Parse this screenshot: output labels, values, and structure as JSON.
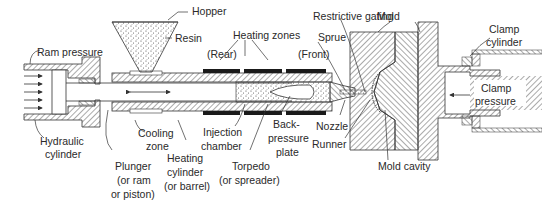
{
  "diagram": {
    "colors": {
      "line": "#333333",
      "hatch": "#555555",
      "heater": "#1a1a1a",
      "background": "#ffffff",
      "resin_dots": "#444444"
    },
    "labels": {
      "ram_pressure": "Ram pressure",
      "hydraulic_cylinder_1": "Hydraulic",
      "hydraulic_cylinder_2": "cylinder",
      "hopper": "Hopper",
      "resin": "Resin",
      "heating_zones": "Heating zones",
      "rear": "(Rear)",
      "front": "(Front)",
      "restrictive_gating": "Restrictive gating",
      "sprue": "Sprue",
      "mold": "Mold",
      "clamp_cylinder_1": "Clamp",
      "clamp_cylinder_2": "cylinder",
      "clamp_pressure_1": "Clamp",
      "clamp_pressure_2": "pressure",
      "cooling_zone_1": "Cooling",
      "cooling_zone_2": "zone",
      "plunger_1": "Plunger",
      "plunger_2": "(or ram",
      "plunger_3": "or piston)",
      "heating_cylinder_1": "Heating",
      "heating_cylinder_2": "cylinder",
      "heating_cylinder_3": "(or barrel)",
      "injection_chamber_1": "Injection",
      "injection_chamber_2": "chamber",
      "torpedo_1": "Torpedo",
      "torpedo_2": "(or spreader)",
      "back_pressure_1": "Back-",
      "back_pressure_2": "pressure",
      "back_pressure_3": "plate",
      "nozzle": "Nozzle",
      "runner": "Runner",
      "mold_cavity": "Mold cavity"
    }
  }
}
